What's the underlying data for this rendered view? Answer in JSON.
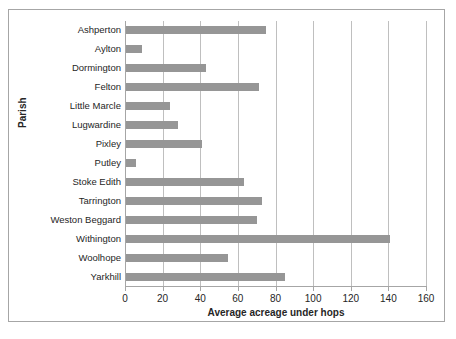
{
  "chart_data": {
    "type": "bar",
    "orientation": "horizontal",
    "title": "",
    "xlabel": "Average acreage under hops",
    "ylabel": "Parish",
    "xlim": [
      0,
      160
    ],
    "xticks": [
      0,
      20,
      40,
      60,
      80,
      100,
      120,
      140,
      160
    ],
    "grid": "vertical",
    "legend": "none",
    "bar_color": "#969696",
    "categories": [
      "Ashperton",
      "Aylton",
      "Dormington",
      "Felton",
      "Little Marcle",
      "Lugwardine",
      "Pixley",
      "Putley",
      "Stoke Edith",
      "Tarrington",
      "Weston Beggard",
      "Withington",
      "Woolhope",
      "Yarkhill"
    ],
    "values": [
      75,
      9,
      43,
      71,
      24,
      28,
      41,
      6,
      63,
      73,
      70,
      141,
      55,
      85
    ]
  }
}
